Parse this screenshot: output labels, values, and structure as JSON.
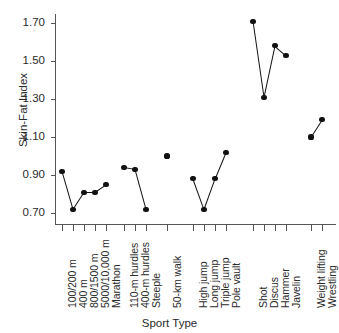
{
  "chart_data": {
    "type": "scatter",
    "title": "",
    "xlabel": "Sport Type",
    "ylabel": "Skin-Fat Index",
    "ylim": [
      0.62,
      1.78
    ],
    "yticks": [
      0.7,
      0.9,
      1.1,
      1.3,
      1.5,
      1.7
    ],
    "ytick_labels": [
      "0.70",
      "0.90",
      "1.10",
      "1.30",
      "1.50",
      "1.70"
    ],
    "grid": false,
    "legend": null,
    "note": "Points within a group are connected by line segments; isolated points are unconnected.",
    "categories": [
      "100/200 m",
      "400 m",
      "800/1500 m",
      "5000/10,000 m",
      "Marathon",
      "110-m hurdles",
      "400-m hurdles",
      "Steeple",
      "50-km walk",
      "High jump",
      "Long jump",
      "Triple jump",
      "Pole vault",
      "Shot",
      "Discus",
      "Hammer",
      "Javelin",
      "Weight lifting",
      "Wrestling"
    ],
    "values": [
      0.92,
      0.72,
      0.81,
      0.81,
      0.85,
      0.94,
      0.93,
      0.72,
      1.0,
      0.88,
      0.72,
      0.88,
      1.02,
      1.71,
      1.31,
      1.58,
      1.53,
      1.1,
      1.19
    ],
    "groups": [
      {
        "name": "Running events",
        "categories": [
          "100/200 m",
          "400 m",
          "800/1500 m",
          "5000/10,000 m",
          "Marathon"
        ],
        "values": [
          0.92,
          0.72,
          0.81,
          0.81,
          0.85
        ],
        "connected": true
      },
      {
        "name": "Hurdles and steeplechase",
        "categories": [
          "110-m hurdles",
          "400-m hurdles",
          "Steeple"
        ],
        "values": [
          0.94,
          0.93,
          0.72
        ],
        "connected": true
      },
      {
        "name": "Race walking",
        "categories": [
          "50-km walk"
        ],
        "values": [
          1.0
        ],
        "connected": false
      },
      {
        "name": "Jumping events",
        "categories": [
          "High jump",
          "Long jump",
          "Triple jump",
          "Pole vault"
        ],
        "values": [
          0.88,
          0.72,
          0.88,
          1.02
        ],
        "connected": true
      },
      {
        "name": "Throwing events",
        "categories": [
          "Shot",
          "Discus",
          "Hammer",
          "Javelin"
        ],
        "values": [
          1.71,
          1.31,
          1.58,
          1.53
        ],
        "connected": true
      },
      {
        "name": "Strength sports",
        "categories": [
          "Weight lifting",
          "Wrestling"
        ],
        "values": [
          1.1,
          1.19
        ],
        "connected": true
      }
    ]
  },
  "axis": {
    "y_title": "Skin-Fat Index",
    "x_title": "Sport Type"
  }
}
